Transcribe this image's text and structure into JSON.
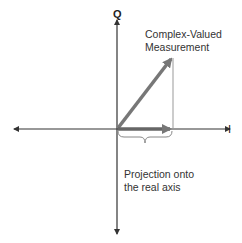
{
  "diagram": {
    "title": "",
    "axes": {
      "vertical_label": "Q",
      "horizontal_label": "I"
    },
    "annotations": {
      "measurement_line1": "Complex-Valued",
      "measurement_line2": "Measurement",
      "projection_line1": "Projection onto",
      "projection_line2": "the real axis"
    },
    "colors": {
      "axis": "#333333",
      "vector": "#777777",
      "projection": "#666666",
      "guide": "#888888",
      "text": "#333333"
    }
  }
}
